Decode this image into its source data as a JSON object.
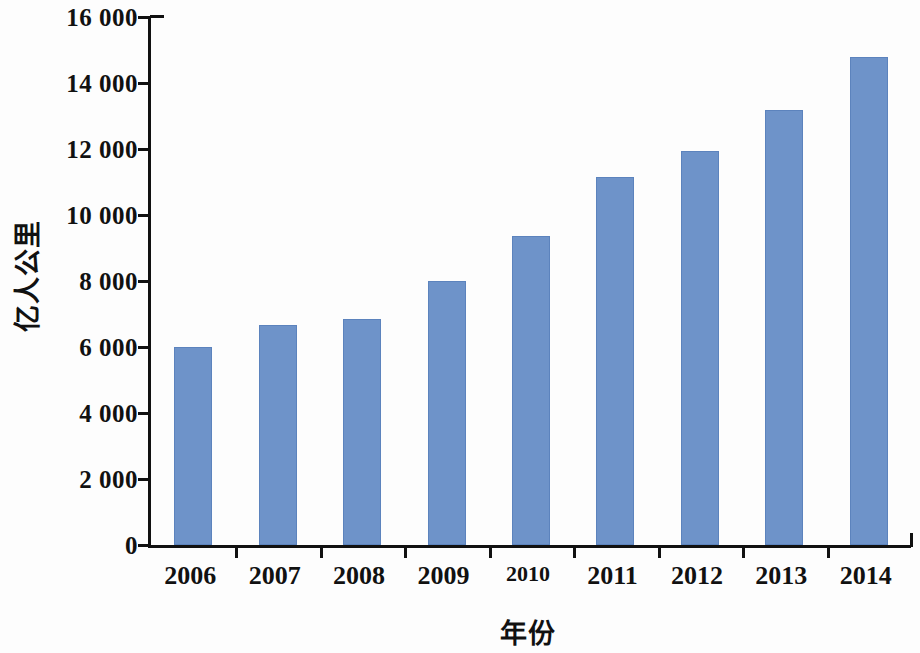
{
  "chart_data": {
    "type": "bar",
    "title": "",
    "subtitle": "",
    "xlabel": "年份",
    "ylabel": "亿人公里",
    "categories": [
      "2006",
      "2007",
      "2008",
      "2009",
      "2010",
      "2011",
      "2012",
      "2013",
      "2014"
    ],
    "values": [
      6000,
      6667,
      6850,
      8000,
      9360,
      11150,
      11940,
      13180,
      14790
    ],
    "series": [
      {
        "name": "亿人公里",
        "values": [
          6000,
          6667,
          6850,
          8000,
          9360,
          11150,
          11940,
          13180,
          14790
        ]
      }
    ],
    "ylim": [
      0,
      16000
    ],
    "ytick_values": [
      0,
      2000,
      4000,
      6000,
      8000,
      10000,
      12000,
      14000,
      16000
    ],
    "ytick_labels": [
      "0",
      "2 000",
      "4 000",
      "6 000",
      "8 000",
      "10 000",
      "12 000",
      "14 000",
      "16 000"
    ],
    "grid": false,
    "legend": "none",
    "bar_color": "#6e93c9",
    "bar_edge_color": "#5c83bd",
    "axis_color": "#111111"
  }
}
